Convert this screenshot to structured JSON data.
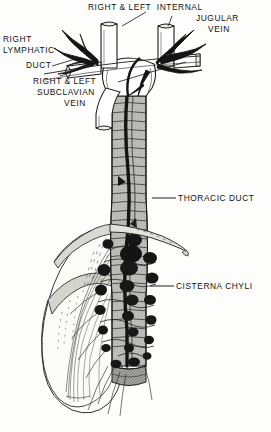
{
  "figure": {
    "title_visible": false,
    "style": "vintage-pen-and-ink-anatomical-illustration",
    "background_color": "#fdfdfb",
    "ink_color": "#121212",
    "duct_fill_color": "#b9b9b4",
    "node_color": "#1a1a1a",
    "muscle_fill_color": "#fafaf7"
  },
  "labels": [
    {
      "id": "internal-jugular-vein",
      "lines": [
        "RIGHT & LEFT  INTERNAL",
        "JUGULAR",
        "VEIN"
      ],
      "line1": "RIGHT & LEFT  INTERNAL",
      "line2": "JUGULAR",
      "line3": "VEIN"
    },
    {
      "id": "right-lymphatic-duct",
      "lines": [
        "RIGHT",
        "LYMPHATIC",
        "DUCT"
      ],
      "line1": "RIGHT",
      "line2": "LYMPHATIC",
      "line3": "DUCT"
    },
    {
      "id": "subclavian-vein",
      "lines": [
        "RIGHT & LEFT",
        "SUBCLAVIAN",
        "VEIN"
      ],
      "line1": "RIGHT & LEFT",
      "line2": "SUBCLAVIAN",
      "line3": "VEIN"
    },
    {
      "id": "thoracic-duct",
      "text": "THORACIC DUCT"
    },
    {
      "id": "cisterna-chyli",
      "text": "CISTERNA CHYLI"
    }
  ],
  "label_text": {
    "jugular_1": "RIGHT & LEFT  INTERNAL",
    "jugular_2": "JUGULAR",
    "jugular_3": "VEIN",
    "lymphatic_1": "RIGHT",
    "lymphatic_2": "LYMPHATIC",
    "lymphatic_3": "DUCT",
    "subclavian_1": "RIGHT & LEFT",
    "subclavian_2": "SUBCLAVIAN",
    "subclavian_3": "VEIN",
    "thoracic_duct": "THORACIC DUCT",
    "cisterna_chyli": "CISTERNA CHYLI"
  }
}
